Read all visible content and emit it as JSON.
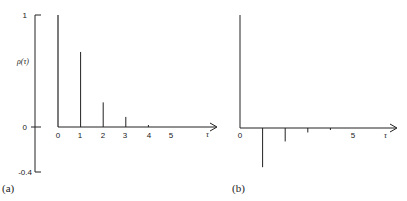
{
  "chart_data": [
    {
      "panel": "(a)",
      "type": "bar",
      "title": "",
      "xlabel": "τ",
      "ylabel": "ρ(τ)",
      "x": [
        0,
        1,
        2,
        3,
        4,
        5
      ],
      "values": [
        1.0,
        0.67,
        0.22,
        0.09,
        0.01,
        0.0
      ],
      "x_tick_labels": [
        "0",
        "1",
        "2",
        "3",
        "4",
        "5"
      ],
      "y_tick_labels": [
        "1",
        "0",
        "-0.4"
      ],
      "ylim": [
        -0.4,
        1
      ],
      "grid": false,
      "legend": null
    },
    {
      "panel": "(b)",
      "type": "bar",
      "title": "",
      "xlabel": "τ",
      "ylabel": "",
      "x": [
        0,
        1,
        2,
        3,
        4,
        5
      ],
      "values": [
        1.0,
        -0.35,
        -0.12,
        -0.04,
        -0.015,
        0.0
      ],
      "x_tick_labels": [
        "0",
        "5"
      ],
      "y_tick_labels": [],
      "ylim": [
        -0.4,
        1
      ],
      "grid": false,
      "legend": null
    }
  ],
  "labels": {
    "a": {
      "panel": "(a)",
      "ylabel": "ρ(τ)",
      "xlabel": "τ",
      "ytick_top": "1",
      "ytick_zero": "0",
      "ytick_bottom": "-0.4",
      "xticks": [
        "0",
        "1",
        "2",
        "3",
        "4",
        "5"
      ]
    },
    "b": {
      "panel": "(b)",
      "xlabel": "τ",
      "xtick_0": "0",
      "xtick_5": "5"
    }
  }
}
